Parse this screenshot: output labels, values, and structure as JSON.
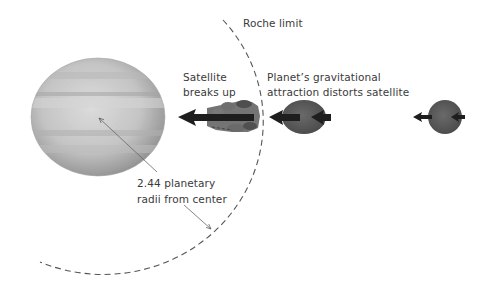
{
  "diagram": {
    "type": "scientific-illustration",
    "labels": {
      "roche_limit": "Roche limit",
      "breaks_up_line1": "Satellite",
      "breaks_up_line2": "breaks up",
      "distorts_line1": "Planet’s gravitational",
      "distorts_line2": "attraction distorts satellite",
      "distance_line1": "2.44 planetary",
      "distance_line2": "radii from center"
    },
    "elements": {
      "planet": "banded gas giant (gray)",
      "roche_boundary": "dashed arc",
      "satellites": [
        {
          "state": "intact",
          "position": "far right"
        },
        {
          "state": "distorted",
          "position": "just outside Roche limit"
        },
        {
          "state": "breaking up",
          "position": "inside Roche limit"
        }
      ]
    },
    "colors": {
      "satellite": "#5a5a5a",
      "arrow": "#1e1e1e",
      "dashed_arc": "#555555",
      "text": "#3a3a3a"
    }
  }
}
